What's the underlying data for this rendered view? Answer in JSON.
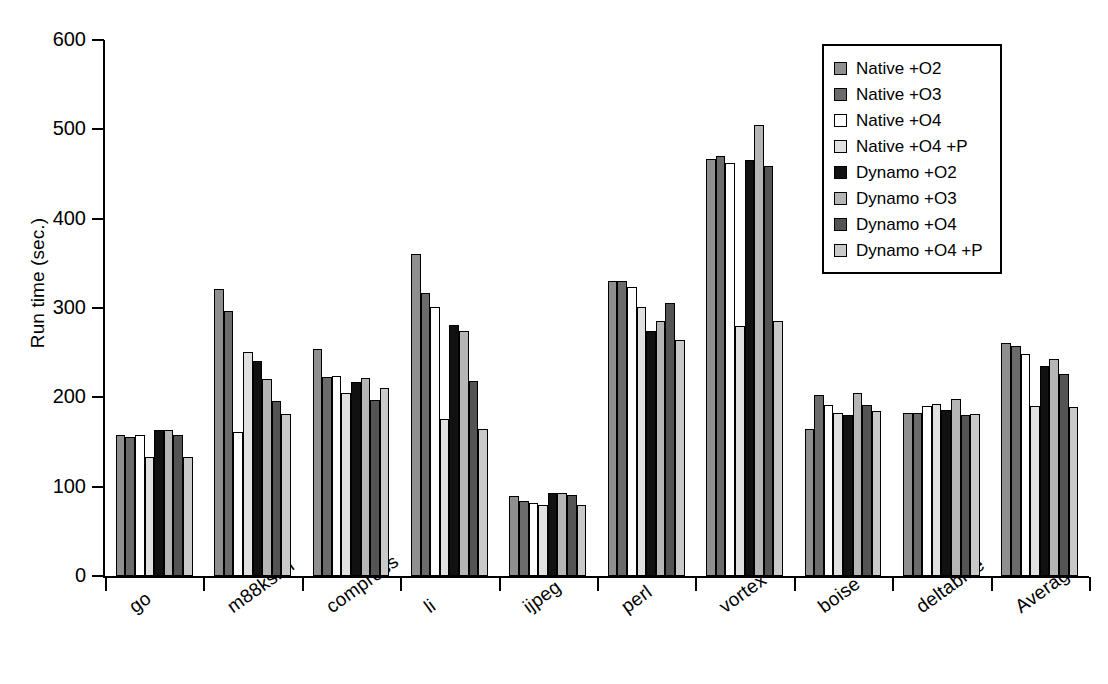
{
  "chart_data": {
    "type": "bar",
    "title": "",
    "subtitle": "",
    "xlabel": "",
    "ylabel": "Run time (sec.)",
    "ylim": [
      0,
      600
    ],
    "yticks": [
      0,
      100,
      200,
      300,
      400,
      500,
      600
    ],
    "ytick_labels": [
      "0",
      "100",
      "200",
      "300",
      "400",
      "500",
      "600"
    ],
    "grid": false,
    "legend_position": "top-right",
    "categories": [
      "go",
      "m88ksim",
      "compress",
      "li",
      "ijpeg",
      "perl",
      "vortex",
      "boise",
      "deltablue",
      "Average"
    ],
    "series": [
      {
        "name": "Native +O2",
        "color": "#8f8f8f",
        "values": [
          158,
          321,
          254,
          361,
          90,
          330,
          467,
          165,
          183,
          261
        ]
      },
      {
        "name": "Native +O3",
        "color": "#6b6b6b",
        "values": [
          156,
          297,
          223,
          317,
          84,
          330,
          470,
          203,
          183,
          257
        ]
      },
      {
        "name": "Native +O4",
        "color": "#ffffff",
        "values": [
          158,
          161,
          224,
          301,
          82,
          324,
          462,
          191,
          190,
          249
        ]
      },
      {
        "name": "Native +O4 +P",
        "color": "#e0e0e0",
        "values": [
          133,
          251,
          205,
          176,
          79,
          301,
          280,
          182,
          192,
          190
        ]
      },
      {
        "name": "Dynamo +O2",
        "color": "#111111",
        "values": [
          164,
          241,
          217,
          281,
          93,
          274,
          466,
          180,
          186,
          235
        ]
      },
      {
        "name": "Dynamo +O3",
        "color": "#b5b5b5",
        "values": [
          163,
          221,
          222,
          274,
          93,
          286,
          505,
          205,
          198,
          243
        ]
      },
      {
        "name": "Dynamo +O4",
        "color": "#545454",
        "values": [
          158,
          196,
          197,
          218,
          91,
          306,
          459,
          191,
          180,
          226
        ]
      },
      {
        "name": "Dynamo +O4 +P",
        "color": "#c9c9c9",
        "values": [
          133,
          181,
          211,
          165,
          79,
          264,
          285,
          185,
          181,
          189
        ]
      }
    ]
  },
  "legend": {
    "entries": [
      {
        "label": "Native +O2"
      },
      {
        "label": "Native +O3"
      },
      {
        "label": "Native +O4"
      },
      {
        "label": "Native +O4 +P"
      },
      {
        "label": "Dynamo +O2"
      },
      {
        "label": "Dynamo +O3"
      },
      {
        "label": "Dynamo +O4"
      },
      {
        "label": "Dynamo +O4 +P"
      }
    ]
  }
}
